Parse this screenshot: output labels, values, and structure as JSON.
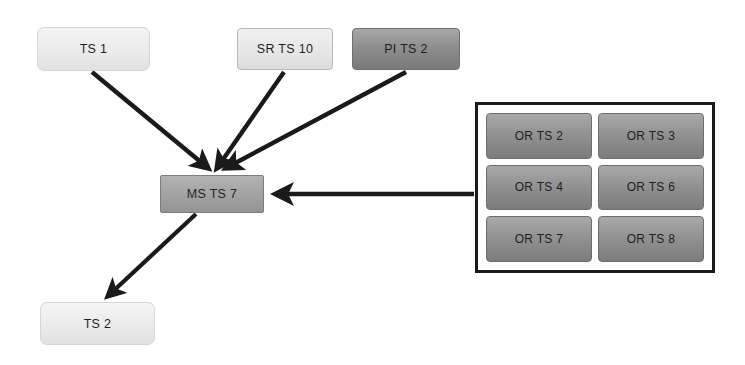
{
  "canvas": {
    "width": 745,
    "height": 365,
    "background": "#ffffff"
  },
  "palette": {
    "edge": "#1a1a1a",
    "light_node": "#ededed",
    "medium_node": "#a3a3a3",
    "dark_node": "#8e8e8e",
    "group_border": "#1a1a1a"
  },
  "nodes": {
    "ts1": {
      "label": "TS 1",
      "x": 37,
      "y": 27,
      "w": 113,
      "h": 44,
      "style": "light"
    },
    "srts10": {
      "label": "SR TS 10",
      "x": 237,
      "y": 28,
      "w": 96,
      "h": 42,
      "style": "light-outline"
    },
    "pits2": {
      "label": "PI TS 2",
      "x": 352,
      "y": 28,
      "w": 108,
      "h": 42,
      "style": "dark"
    },
    "msts7": {
      "label": "MS TS 7",
      "x": 160,
      "y": 175,
      "w": 104,
      "h": 38,
      "style": "medium"
    },
    "ts2": {
      "label": "TS 2",
      "x": 40,
      "y": 302,
      "w": 115,
      "h": 43,
      "style": "light"
    }
  },
  "or_group": {
    "x": 475,
    "y": 102,
    "w": 240,
    "h": 171,
    "cells": [
      {
        "label": "OR TS 2"
      },
      {
        "label": "OR TS 3"
      },
      {
        "label": "OR TS 4"
      },
      {
        "label": "OR TS 6"
      },
      {
        "label": "OR TS 7"
      },
      {
        "label": "OR TS 8"
      }
    ]
  },
  "edges": [
    {
      "name": "ts1-to-msts7",
      "from": "TS 1",
      "to": "MS TS 7",
      "d": "M 92 72 L 208 168"
    },
    {
      "name": "srts10-to-msts7",
      "from": "SR TS 10",
      "to": "MS TS 7",
      "d": "M 284 72 L 217 168"
    },
    {
      "name": "pits2-to-msts7",
      "from": "PI TS 2",
      "to": "MS TS 7",
      "d": "M 406 72 L 226 168"
    },
    {
      "name": "orgroup-to-msts7",
      "from": "OR group",
      "to": "MS TS 7",
      "d": "M 474 194 L 274 194"
    },
    {
      "name": "msts7-to-ts2",
      "from": "MS TS 7",
      "to": "TS 2",
      "d": "M 196 214 L 106 298"
    }
  ]
}
